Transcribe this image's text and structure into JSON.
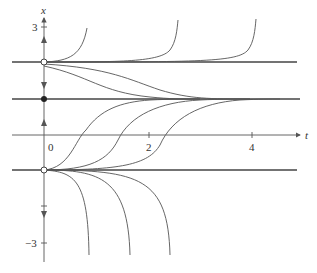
{
  "figure": {
    "axes": {
      "horizontal_label": "t",
      "vertical_label": "x",
      "t_ticks": [
        "0",
        "2",
        "4"
      ],
      "x_ticks": [
        "3",
        "−3"
      ]
    },
    "equilibria": [
      {
        "x": 2,
        "stability": "unstable",
        "marker": "open-circle"
      },
      {
        "x": 1,
        "stability": "stable",
        "marker": "filled-circle"
      },
      {
        "x": -1,
        "stability": "unstable",
        "marker": "open-circle"
      }
    ],
    "phase_arrows": [
      {
        "region": "x > 2",
        "direction": "up"
      },
      {
        "region": "1 < x < 2",
        "direction": "down"
      },
      {
        "region": "-1 < x < 1",
        "direction": "up"
      },
      {
        "region": "x < -1",
        "direction": "down"
      }
    ],
    "colors": {
      "line": "#444444",
      "axis": "#555555",
      "background": "#ffffff"
    }
  }
}
